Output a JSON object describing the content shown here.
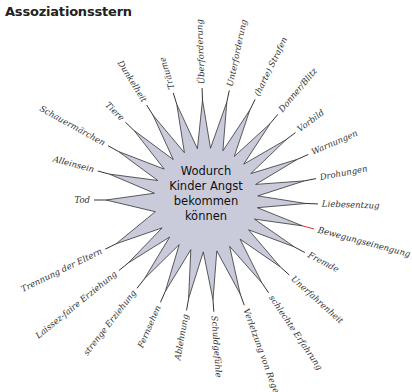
{
  "title": "Assoziationsstern",
  "center": {
    "lines": [
      "Wodurch",
      "Kinder Angst",
      "bekommen",
      "können"
    ]
  },
  "colors": {
    "star_fill": "#c9cbdb",
    "star_stroke": "#333333",
    "accent_line": "#e0303a"
  },
  "spokes": [
    {
      "label": "Überforderung",
      "angle": -92
    },
    {
      "label": "Unterforderung",
      "angle": -78
    },
    {
      "label": "(harte) Strafen",
      "angle": -64
    },
    {
      "label": "Donner/Blitz",
      "angle": -50
    },
    {
      "label": "Vorbild",
      "angle": -37
    },
    {
      "label": "Warnungen",
      "angle": -24
    },
    {
      "label": "Drohungen",
      "angle": -11
    },
    {
      "label": "Liebesentzug",
      "angle": 2
    },
    {
      "label": "Bewegungseinengung",
      "angle": 15
    },
    {
      "label": "Fremde",
      "angle": 28
    },
    {
      "label": "Unerfahrenheit",
      "angle": 42
    },
    {
      "label": "schlechte Erfahrung",
      "angle": 56
    },
    {
      "label": "Verletzung von Regeln",
      "angle": 70
    },
    {
      "label": "Schuldgefühle",
      "angle": 86
    },
    {
      "label": "Ablehnung",
      "angle": 100
    },
    {
      "label": "Fernsehen",
      "angle": 114
    },
    {
      "label": "strenge Erziehung",
      "angle": 128
    },
    {
      "label": "Laissez-faire Erziehung",
      "angle": 141
    },
    {
      "label": "Trennung der Eltern",
      "angle": 154
    },
    {
      "label": "Tod",
      "angle": 180
    },
    {
      "label": "Alleinsein",
      "angle": 195
    },
    {
      "label": "Schauermärchen",
      "angle": 209
    },
    {
      "label": "Tiere",
      "angle": 224
    },
    {
      "label": "Dunkelheit",
      "angle": 238
    },
    {
      "label": "Träume",
      "angle": 253
    }
  ]
}
